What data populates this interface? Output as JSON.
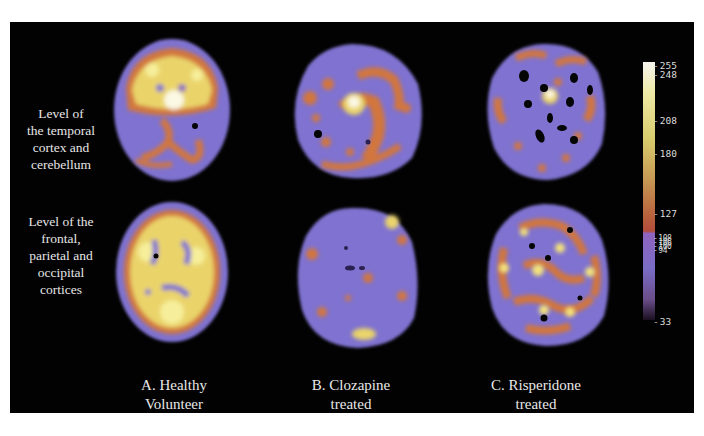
{
  "figure": {
    "row_labels": [
      {
        "lines": [
          "Level of",
          "the temporal",
          "cortex and",
          "cerebellum"
        ]
      },
      {
        "lines": [
          "Level of the",
          "frontal,",
          "parietal and",
          "occipital",
          "cortices"
        ]
      }
    ],
    "column_labels": [
      {
        "lines": [
          "A. Healthy",
          "Volunteer"
        ]
      },
      {
        "lines": [
          "B. Clozapine",
          "treated"
        ]
      },
      {
        "lines": [
          "C. Risperidone",
          "treated"
        ]
      }
    ],
    "panels": [
      {
        "row": 0,
        "col": 0,
        "description": "Axial brain scan, healthy volunteer, temporal cortex/cerebellum level — high uptake (yellow/white) across anterior cortex, orange streaks in cerebellum"
      },
      {
        "row": 0,
        "col": 1,
        "description": "Axial brain scan, clozapine treated, temporal cortex/cerebellum level — mostly purple with scattered orange/yellow foci, bright central spot"
      },
      {
        "row": 0,
        "col": 2,
        "description": "Axial brain scan, risperidone treated, temporal cortex/cerebellum level — purple with dark holes and sparse orange/yellow foci"
      },
      {
        "row": 1,
        "col": 0,
        "description": "Axial brain scan, healthy volunteer, frontal/parietal/occipital level — widespread yellow/orange cortical uptake with purple rim"
      },
      {
        "row": 1,
        "col": 1,
        "description": "Axial brain scan, clozapine treated, frontal/parietal/occipital level — predominantly purple, few small orange spots, bright occipital focus"
      },
      {
        "row": 1,
        "col": 2,
        "description": "Axial brain scan, risperidone treated, frontal/parietal/occipital level — dense mottled yellow/orange pattern on purple"
      }
    ],
    "colorbar": {
      "ticks": [
        {
          "label": "255",
          "top": 39
        },
        {
          "label": "248",
          "top": 48
        },
        {
          "label": "208",
          "top": 94
        },
        {
          "label": "180",
          "top": 127
        },
        {
          "label": "127",
          "top": 187
        },
        {
          "label": "108",
          "top": 214,
          "compact": true
        },
        {
          "label": "106",
          "top": 218,
          "compact": true
        },
        {
          "label": "100",
          "top": 222,
          "compact": true
        },
        {
          "label": "94",
          "top": 226,
          "compact": true
        },
        {
          "label": "33",
          "top": 295
        }
      ],
      "gradient_stops": [
        {
          "offset": 0,
          "color": "#f6f4ee"
        },
        {
          "offset": 0.12,
          "color": "#eee9a6"
        },
        {
          "offset": 0.3,
          "color": "#d8cc6c"
        },
        {
          "offset": 0.45,
          "color": "#c79a55"
        },
        {
          "offset": 0.6,
          "color": "#b8603c"
        },
        {
          "offset": 0.655,
          "color": "#b24c3c"
        },
        {
          "offset": 0.665,
          "color": "#8e64c0"
        },
        {
          "offset": 0.8,
          "color": "#7a6cc6"
        },
        {
          "offset": 0.92,
          "color": "#6a4e8a"
        },
        {
          "offset": 1,
          "color": "#1a1020"
        }
      ]
    },
    "colors": {
      "background": "#020202",
      "page": "#ffffff",
      "text": "#e6e6e6",
      "purple": "#7f72d0",
      "orange": "#d2763e",
      "yellow": "#f2e277",
      "white_hot": "#fbf8e4"
    }
  }
}
